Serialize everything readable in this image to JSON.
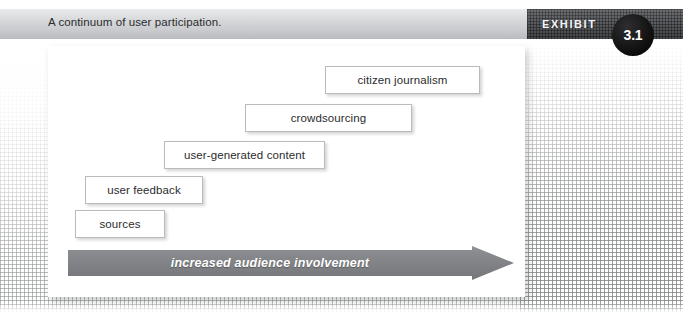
{
  "header": {
    "title": "A continuum of user participation.",
    "exhibit_label": "EXHIBIT",
    "exhibit_number": "3.1",
    "banner_light_color": "#d6d8da",
    "banner_dark_color": "#585a5d",
    "badge_color": "#000000"
  },
  "diagram": {
    "steps": [
      {
        "label": "citizen journalism",
        "left": 325,
        "top": 66,
        "width": 155,
        "height": 28
      },
      {
        "label": "crowdsourcing",
        "left": 245,
        "top": 104,
        "width": 167,
        "height": 28
      },
      {
        "label": "user-generated content",
        "left": 164,
        "top": 141,
        "width": 161,
        "height": 28
      },
      {
        "label": "user feedback",
        "left": 85,
        "top": 176,
        "width": 118,
        "height": 28
      },
      {
        "label": "sources",
        "left": 75,
        "top": 210,
        "width": 90,
        "height": 28
      }
    ],
    "arrow": {
      "label": "increased audience involvement",
      "direction": "right",
      "color": "#808285"
    },
    "box_border_color": "#b9bcbf",
    "panel_color": "#ffffff"
  }
}
